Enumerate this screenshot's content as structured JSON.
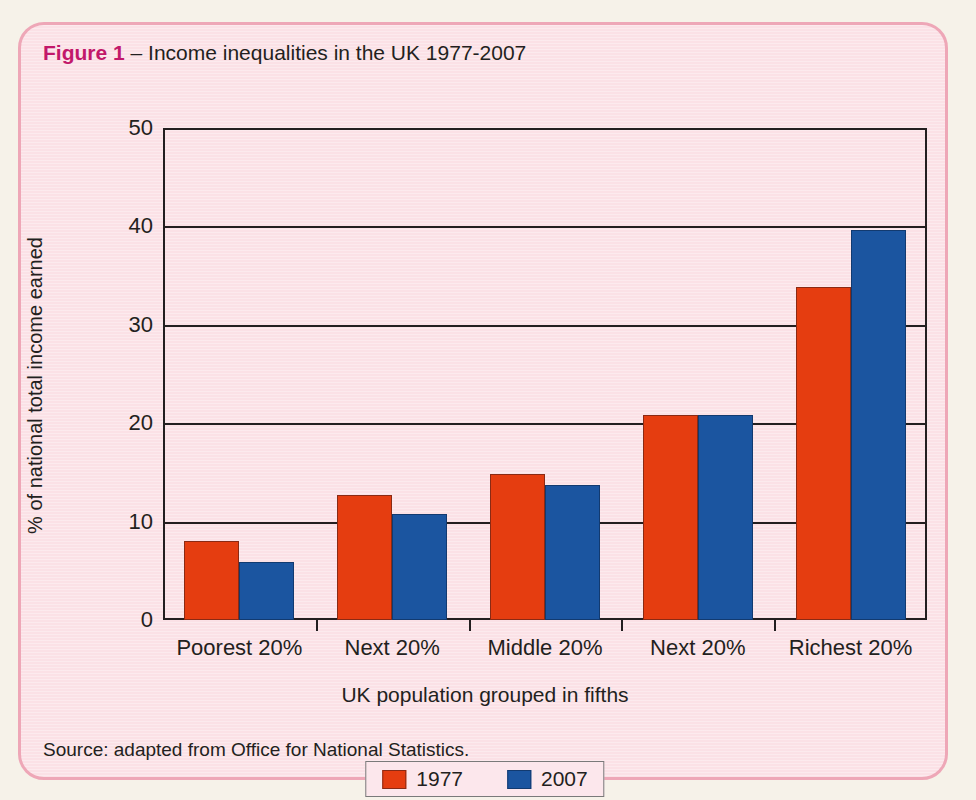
{
  "figure": {
    "number_label": "Figure 1",
    "dash": " – ",
    "title": "Income inequalities in the UK 1977-2007",
    "source": "Source: adapted from Office for National Statistics.",
    "panel_color": "#fbe1e6",
    "panel_border_color": "#eea7b7",
    "number_color": "#c2186a"
  },
  "chart_data": {
    "type": "bar",
    "title": "Income inequalities in the UK 1977-2007",
    "subtitle": "",
    "categories": [
      "Poorest 20%",
      "Next 20%",
      "Middle 20%",
      "Next 20%",
      "Richest 20%"
    ],
    "series": [
      {
        "name": "1977",
        "color": "#e53d10",
        "values": [
          8.0,
          12.7,
          14.8,
          20.8,
          33.8
        ]
      },
      {
        "name": "2007",
        "color": "#1b55a0",
        "values": [
          5.9,
          10.8,
          13.7,
          20.8,
          39.6
        ]
      }
    ],
    "xlabel": "UK population grouped in fifths",
    "ylabel": "% of national total income earned",
    "ylim": [
      0,
      50
    ],
    "yticks": [
      50,
      40,
      30,
      20,
      10,
      0
    ],
    "ytick_labels": [
      "50",
      "40",
      "30",
      "20",
      "10",
      "0"
    ],
    "grid": true,
    "grid_axis": "y",
    "legend_position": "bottom",
    "legend_entries": [
      "1977",
      "2007"
    ]
  }
}
